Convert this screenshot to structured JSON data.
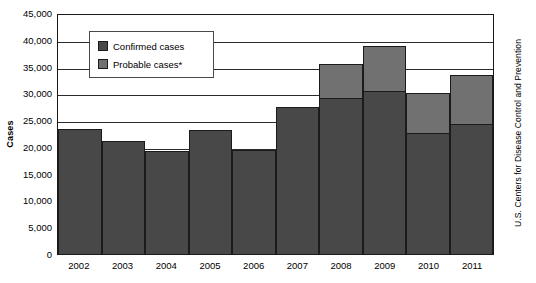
{
  "chart_data": {
    "type": "bar",
    "stacked": true,
    "title": "",
    "xlabel": "",
    "ylabel": "Cases",
    "ylim": [
      0,
      45000
    ],
    "ytick_step": 5000,
    "ytick_labels": [
      "45,000",
      "40,000",
      "35,000",
      "30,000",
      "25,000",
      "20,000",
      "15,000",
      "10,000",
      "5,000",
      "0"
    ],
    "ytick_values": [
      45000,
      40000,
      35000,
      30000,
      25000,
      20000,
      15000,
      10000,
      5000,
      0
    ],
    "grid": true,
    "grid_axis": "y",
    "legend_position": "upper-left-inside",
    "categories": [
      "2002",
      "2003",
      "2004",
      "2005",
      "2006",
      "2007",
      "2008",
      "2009",
      "2010",
      "2011"
    ],
    "series": [
      {
        "name": "Confirmed cases",
        "color": "#484848",
        "values": [
          23400,
          21100,
          19200,
          23200,
          19400,
          27400,
          29200,
          30400,
          22600,
          24300
        ]
      },
      {
        "name": "Probable cases*",
        "color": "#717171",
        "values": [
          0,
          0,
          0,
          0,
          0,
          0,
          6200,
          8400,
          7400,
          9100
        ]
      }
    ],
    "totals": [
      23400,
      21100,
      19200,
      23200,
      19400,
      27400,
      35400,
      38800,
      30000,
      33400
    ],
    "annotations": [
      "U.S. Centers for Disease Control and Prevention"
    ]
  },
  "legend": {
    "items": [
      {
        "label": "Confirmed cases",
        "swatch": "dark"
      },
      {
        "label": "Probable cases*",
        "swatch": "light"
      }
    ]
  },
  "source": {
    "credit": "U.S. Centers for Disease Control and Prevention"
  },
  "colors": {
    "confirmed": "#484848",
    "probable": "#717171",
    "axis": "#1a1a1a",
    "grid": "#2b2b2b",
    "background": "#ffffff"
  }
}
